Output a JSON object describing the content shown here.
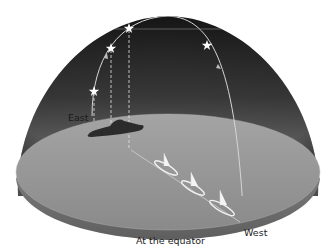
{
  "diagram": {
    "caption": "At the equator",
    "labels": {
      "east": "East",
      "west": "West"
    },
    "colors": {
      "dome_top": "#1c1c1c",
      "dome_bottom": "#8a8a8a",
      "ground": "#9a9a9a",
      "ground_edge": "#6e6e6e",
      "star_path": "#d8d8d8",
      "star": "#ffffff",
      "island": "#2e2e2e",
      "boat": "#f2f2f2"
    },
    "stars": [
      {
        "name": "star-1",
        "x": 94,
        "y": 91
      },
      {
        "name": "star-2",
        "x": 111,
        "y": 48
      },
      {
        "name": "star-3",
        "x": 129,
        "y": 28
      },
      {
        "name": "star-4",
        "x": 207,
        "y": 45
      }
    ],
    "boats": [
      {
        "name": "boat-1",
        "x": 163,
        "y": 165
      },
      {
        "name": "boat-2",
        "x": 191,
        "y": 186
      },
      {
        "name": "boat-3",
        "x": 220,
        "y": 206
      }
    ]
  }
}
